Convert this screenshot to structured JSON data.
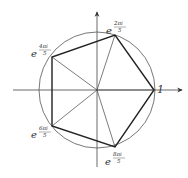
{
  "colors": {
    "stroke": "#333333",
    "thin": "#555555",
    "background": "#ffffff"
  },
  "center": [
    97,
    90
  ],
  "radius": 57,
  "labels": {
    "one": "1",
    "v1": {
      "base": "e",
      "num": "2πi",
      "den": "5"
    },
    "v2": {
      "base": "e",
      "num": "4πi",
      "den": "5"
    },
    "v3": {
      "base": "e",
      "num": "6πi",
      "den": "5"
    },
    "v4": {
      "base": "e",
      "num": "8πi",
      "den": "5"
    }
  }
}
